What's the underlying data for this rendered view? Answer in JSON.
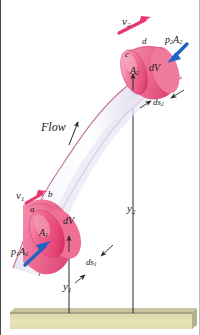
{
  "figure": {
    "kind": "streamtube-fluid-element-diagram",
    "background_color": "#ffffff",
    "ground": {
      "name": "ground-datum-bar",
      "fill_top": "#b0ad8a",
      "fill_body": "#e2deb1"
    },
    "tube": {
      "name": "stream-tube",
      "body_fill_light": "#f2f0fa",
      "body_fill_mid": "#d8d7ec",
      "edge_color": "#c4789f"
    },
    "element_color": {
      "pink_face": "#ef6f96",
      "pink_dark": "#d83f71",
      "pink_light": "#f9a8c0"
    },
    "arrow_colors": {
      "velocity": "#e8376b",
      "pressure": "#1f63c4",
      "leader": "#2a2a2a"
    }
  },
  "labels": {
    "v2": "v",
    "v2_sub": "2",
    "v1": "v",
    "v1_sub": "1",
    "p2A2": "p",
    "p2A2_sub1": "2",
    "p2A2_mid": "A",
    "p2A2_sub2": "2",
    "p1A1": "p",
    "p1A1_sub1": "1",
    "p1A1_mid": "A",
    "p1A1_sub2": "1",
    "corner_a": "a",
    "corner_b": "b",
    "corner_c": "c",
    "corner_d": "d",
    "A2": "A",
    "A2_sub": "2",
    "A1": "A",
    "A1_sub": "1",
    "dV_upper": "dV",
    "dV_lower": "dV",
    "ds2": "ds",
    "ds2_sub": "2",
    "ds1": "ds",
    "ds1_sub": "1",
    "y2": "y",
    "y2_sub": "2",
    "y1": "y",
    "y1_sub": "1",
    "flow": "Flow"
  }
}
